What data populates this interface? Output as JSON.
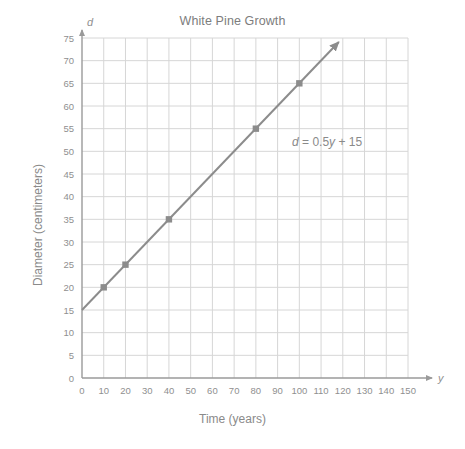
{
  "chart_data": {
    "type": "line",
    "title": "White Pine Growth",
    "xlabel": "Time (years)",
    "ylabel": "Diameter (centimeters)",
    "x_axis_variable": "y",
    "y_axis_variable": "d",
    "xlim": [
      0,
      150
    ],
    "ylim": [
      0,
      75
    ],
    "xticks": [
      0,
      10,
      20,
      30,
      40,
      50,
      60,
      70,
      80,
      90,
      100,
      110,
      120,
      130,
      140,
      150
    ],
    "yticks": [
      0,
      5,
      10,
      15,
      20,
      25,
      30,
      35,
      40,
      45,
      50,
      55,
      60,
      65,
      70,
      75
    ],
    "grid": true,
    "grid_color": "#d6d6d6",
    "legend": "none",
    "equation": "d = 0.5y + 15",
    "equation_parts": {
      "lhs": "d",
      "equals": "=",
      "slope": "0.5",
      "slope_variable": "y",
      "plus": "+",
      "intercept": "15"
    },
    "line": {
      "name": "White pine diameter",
      "color": "#8c8c8c",
      "slope": 0.5,
      "intercept": 15,
      "x_start": 0,
      "y_start": 15,
      "x_end": 120,
      "y_end": 75,
      "arrow_end": true
    },
    "marked_points": [
      {
        "x": 10,
        "y": 20
      },
      {
        "x": 20,
        "y": 25
      },
      {
        "x": 40,
        "y": 35
      },
      {
        "x": 80,
        "y": 55
      },
      {
        "x": 100,
        "y": 65
      }
    ],
    "x": [
      0,
      10,
      20,
      40,
      80,
      100,
      120
    ],
    "values": [
      15,
      20,
      25,
      35,
      55,
      65,
      75
    ]
  },
  "colors": {
    "line": "#8c8c8c",
    "grid": "#d6d6d6",
    "axis": "#9a9a9a",
    "text": "#8a8a8a",
    "marker": "#8c8c8c",
    "background": "#ffffff"
  }
}
